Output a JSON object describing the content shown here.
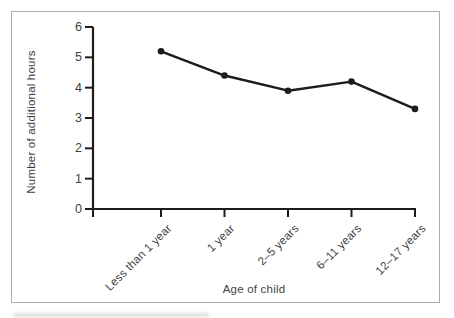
{
  "figure": {
    "border_color": "#adadad",
    "background": "#ffffff",
    "text_color": "#3f3f3f"
  },
  "chart_data": {
    "type": "line",
    "title": "",
    "categories": [
      "Less than 1 year",
      "1 year",
      "2–5 years",
      "6–11 years",
      "12–17 years"
    ],
    "values": [
      5.2,
      4.4,
      3.9,
      4.2,
      3.3
    ],
    "xlabel": "Age of child",
    "ylabel": "Number of additional hours",
    "ylim": [
      0,
      6
    ],
    "yticks": [
      0,
      1,
      2,
      3,
      4,
      5,
      6
    ],
    "grid": false,
    "legend": "none",
    "line_color": "#1c1c1c",
    "marker": "circle"
  }
}
